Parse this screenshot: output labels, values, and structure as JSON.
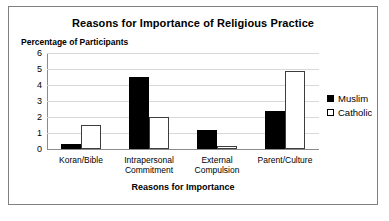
{
  "chart_data": {
    "type": "bar",
    "title": "Reasons for Importance of Religious Practice",
    "xlabel": "Reasons for Importance",
    "ylabel": "Percentage of Participants",
    "categories": [
      "Koran/Bible",
      "Intrapersonal\nCommitment",
      "External\nCompulsion",
      "Parent/Culture"
    ],
    "series": [
      {
        "name": "Muslim",
        "color": "#000000",
        "values": [
          0.3,
          4.5,
          1.2,
          2.35
        ]
      },
      {
        "name": "Catholic",
        "color": "#ffffff",
        "values": [
          1.5,
          2.0,
          0.2,
          4.85
        ]
      }
    ],
    "ylim": [
      0,
      6
    ],
    "yticks": [
      "6",
      "5",
      "4",
      "3",
      "2",
      "1",
      "0"
    ],
    "grid": true,
    "legend_position": "right"
  }
}
